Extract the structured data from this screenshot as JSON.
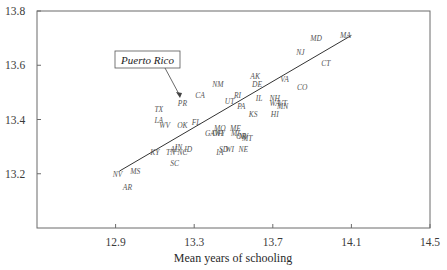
{
  "chart_data": {
    "type": "scatter",
    "title": "",
    "xlabel": "Mean years of schooling",
    "ylabel": "",
    "xlim": [
      12.5,
      14.5
    ],
    "ylim": [
      13.0,
      13.8
    ],
    "x_ticks": [
      "12.9",
      "13.3",
      "13.7",
      "14.1",
      "14.5"
    ],
    "y_ticks": [
      "13.2",
      "13.4",
      "13.6",
      "13.8"
    ],
    "grid": false,
    "legend": null,
    "annotation": {
      "text": "Puerto Rico",
      "points_to": "PR"
    },
    "regression_line": {
      "x1": 12.92,
      "y1": 13.21,
      "x2": 14.1,
      "y2": 13.71
    },
    "points": [
      {
        "label": "MA",
        "x": 14.07,
        "y": 13.71
      },
      {
        "label": "MD",
        "x": 13.92,
        "y": 13.7
      },
      {
        "label": "NJ",
        "x": 13.84,
        "y": 13.65
      },
      {
        "label": "CT",
        "x": 13.97,
        "y": 13.61
      },
      {
        "label": "AK",
        "x": 13.61,
        "y": 13.56
      },
      {
        "label": "VA",
        "x": 13.76,
        "y": 13.55
      },
      {
        "label": "DE",
        "x": 13.62,
        "y": 13.53
      },
      {
        "label": "CO",
        "x": 13.85,
        "y": 13.52
      },
      {
        "label": "NM",
        "x": 13.42,
        "y": 13.53
      },
      {
        "label": "CA",
        "x": 13.33,
        "y": 13.49
      },
      {
        "label": "RI",
        "x": 13.52,
        "y": 13.49
      },
      {
        "label": "IL",
        "x": 13.63,
        "y": 13.48
      },
      {
        "label": "NH",
        "x": 13.71,
        "y": 13.48
      },
      {
        "label": "UT",
        "x": 13.48,
        "y": 13.47
      },
      {
        "label": "VT",
        "x": 13.75,
        "y": 13.46
      },
      {
        "label": "WA",
        "x": 13.71,
        "y": 13.46
      },
      {
        "label": "PA",
        "x": 13.54,
        "y": 13.45
      },
      {
        "label": "MN",
        "x": 13.75,
        "y": 13.45
      },
      {
        "label": "KS",
        "x": 13.6,
        "y": 13.42
      },
      {
        "label": "HI",
        "x": 13.71,
        "y": 13.42
      },
      {
        "label": "PR",
        "x": 13.24,
        "y": 13.46
      },
      {
        "label": "TX",
        "x": 13.12,
        "y": 13.44
      },
      {
        "label": "LA",
        "x": 13.12,
        "y": 13.4
      },
      {
        "label": "WV",
        "x": 13.15,
        "y": 13.38
      },
      {
        "label": "OK",
        "x": 13.24,
        "y": 13.38
      },
      {
        "label": "FL",
        "x": 13.31,
        "y": 13.39
      },
      {
        "label": "MO",
        "x": 13.43,
        "y": 13.37
      },
      {
        "label": "ME",
        "x": 13.51,
        "y": 13.37
      },
      {
        "label": "GA",
        "x": 13.38,
        "y": 13.35
      },
      {
        "label": "OH",
        "x": 13.42,
        "y": 13.35
      },
      {
        "label": "WY",
        "x": 13.43,
        "y": 13.35
      },
      {
        "label": "MI",
        "x": 13.51,
        "y": 13.35
      },
      {
        "label": "OR",
        "x": 13.54,
        "y": 13.34
      },
      {
        "label": "NV",
        "x": 13.55,
        "y": 13.34
      },
      {
        "label": "MT",
        "x": 13.57,
        "y": 13.33
      },
      {
        "label": "NE",
        "x": 13.55,
        "y": 13.29
      },
      {
        "label": "SD",
        "x": 13.45,
        "y": 13.29
      },
      {
        "label": "WI",
        "x": 13.48,
        "y": 13.29
      },
      {
        "label": "IA",
        "x": 13.43,
        "y": 13.28
      },
      {
        "label": "ID",
        "x": 13.27,
        "y": 13.29
      },
      {
        "label": "IN",
        "x": 13.22,
        "y": 13.3
      },
      {
        "label": "AL",
        "x": 13.2,
        "y": 13.29
      },
      {
        "label": "TN",
        "x": 13.18,
        "y": 13.28
      },
      {
        "label": "NC",
        "x": 13.24,
        "y": 13.28
      },
      {
        "label": "KY",
        "x": 13.1,
        "y": 13.28
      },
      {
        "label": "SC",
        "x": 13.2,
        "y": 13.24
      },
      {
        "label": "MS",
        "x": 13.0,
        "y": 13.21
      },
      {
        "label": "NV",
        "x": 12.91,
        "y": 13.2
      },
      {
        "label": "AR",
        "x": 12.96,
        "y": 13.15
      }
    ]
  }
}
